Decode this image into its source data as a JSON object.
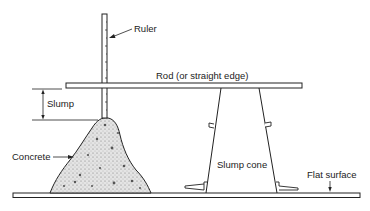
{
  "diagram": {
    "labels": {
      "ruler": "Ruler",
      "rod": "Rod (or straight edge)",
      "slump": "Slump",
      "concrete": "Concrete",
      "slump_cone": "Slump cone",
      "flat_surface": "Flat surface"
    },
    "colors": {
      "line": "#222222",
      "concrete_fill": "#d9d9d9",
      "background": "#ffffff"
    }
  }
}
